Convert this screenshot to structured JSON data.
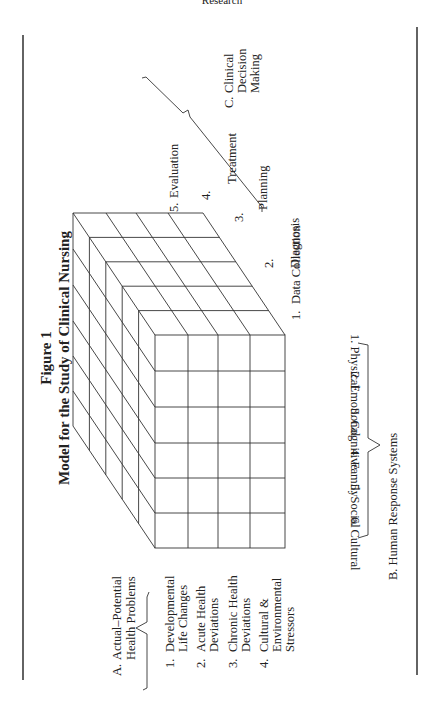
{
  "page": {
    "running_header": "Research",
    "orientation": "rotated-90-ccw"
  },
  "figure": {
    "number": "Figure 1",
    "title": "Model for the Study of Clinical Nursing"
  },
  "axis_a": {
    "heading_letter": "A.",
    "heading_line1": "Actual–Potential",
    "heading_line2": "Health Problems",
    "items": [
      {
        "num": "1.",
        "line1": "Developmental",
        "line2": "Life Changes",
        "line3": ""
      },
      {
        "num": "2.",
        "line1": "Acute Health",
        "line2": "Deviations",
        "line3": ""
      },
      {
        "num": "3.",
        "line1": "Chronic Health",
        "line2": "Deviations",
        "line3": ""
      },
      {
        "num": "4.",
        "line1": "Cultural &",
        "line2": "Environmental",
        "line3": "Stressors"
      }
    ]
  },
  "axis_b": {
    "heading": "B.  Human Response Systems",
    "items": [
      {
        "label": "1.  Physical"
      },
      {
        "label": "2.  Emotional"
      },
      {
        "label": "3.  Cognitive"
      },
      {
        "label": "4.  Family"
      },
      {
        "label": "5.  Social"
      },
      {
        "label": "6.  Cultural"
      }
    ]
  },
  "axis_c": {
    "heading_letter": "C.",
    "heading_line1": "Clinical",
    "heading_line2": "Decision",
    "heading_line3": "Making",
    "items": [
      {
        "num": "1.",
        "label": "Data Collection"
      },
      {
        "num": "2.",
        "label": "Diagnosis"
      },
      {
        "num": "3.",
        "label": "Planning"
      },
      {
        "num": "4.",
        "label": "Treatment"
      },
      {
        "num": "5.",
        "label": "Evaluation"
      }
    ]
  },
  "cube": {
    "rows": 4,
    "columns": 6,
    "depth_layers": 5
  }
}
